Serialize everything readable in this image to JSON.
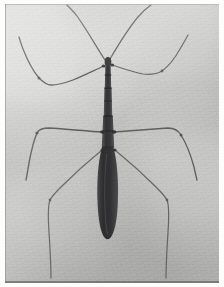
{
  "image": {
    "domain": "Natural-Image",
    "title": "Stick insect specimen photograph",
    "subject_common_name": "Walking stick insect",
    "orientation": "head up, abdomen down",
    "medium": "black and white photographic print",
    "caption": "",
    "width_px": 224,
    "height_px": 287
  },
  "palette": {
    "paper_white": "#fdfdfd",
    "background_gray": "#c9c9c7",
    "background_light_gray": "#d6d6d4",
    "body_dark": "#3a3a3c",
    "body_darkest": "#2b2b2d",
    "limb_gray": "#6d6d6f",
    "limb_light_gray": "#8a8a8c",
    "plate_edge": "#6a6a6a"
  },
  "plate": {
    "left": 5,
    "top": 4,
    "width": 214,
    "height": 279
  },
  "specimen": {
    "parts": [
      {
        "name": "antenna-left",
        "label": "Left antenna",
        "color": "#6a6a6c",
        "width": 1.2
      },
      {
        "name": "antenna-right",
        "label": "Right antenna",
        "color": "#6a6a6c",
        "width": 1.2
      },
      {
        "name": "head",
        "label": "Head",
        "color": "#3a3a3c"
      },
      {
        "name": "prothorax",
        "label": "Prothorax",
        "color": "#3d3d3f"
      },
      {
        "name": "mesothorax",
        "label": "Mesothorax",
        "color": "#3a3a3c"
      },
      {
        "name": "metathorax",
        "label": "Metathorax",
        "color": "#363638"
      },
      {
        "name": "abdomen",
        "label": "Abdomen",
        "color": "#343436"
      },
      {
        "name": "foreleg-left",
        "label": "Left foreleg",
        "color": "#636365",
        "width": 1.3
      },
      {
        "name": "foreleg-right",
        "label": "Right foreleg",
        "color": "#6b6b6d",
        "width": 1.2
      },
      {
        "name": "midleg-left",
        "label": "Left middle leg",
        "color": "#5f5f61",
        "width": 1.4
      },
      {
        "name": "midleg-right",
        "label": "Right middle leg",
        "color": "#646466",
        "width": 1.3
      },
      {
        "name": "hindleg-left",
        "label": "Left hind leg",
        "color": "#6e6e70",
        "width": 1.2
      },
      {
        "name": "hindleg-right",
        "label": "Right hind leg",
        "color": "#6c6c6e",
        "width": 1.2
      }
    ],
    "segment_count": 3,
    "leg_pairs": 3,
    "antenna_count": 2
  }
}
